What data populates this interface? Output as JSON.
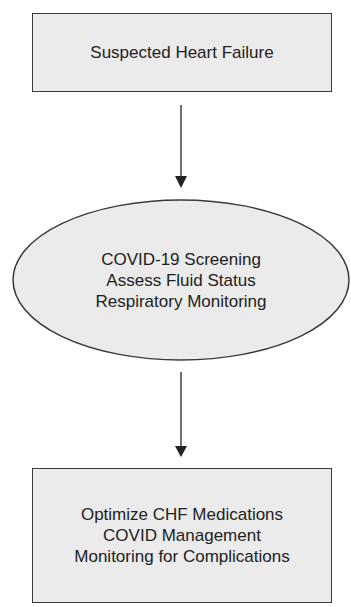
{
  "diagram": {
    "type": "flowchart",
    "nodes": [
      {
        "id": "n1",
        "shape": "rectangle",
        "lines": [
          "Suspected Heart Failure"
        ]
      },
      {
        "id": "n2",
        "shape": "ellipse",
        "lines": [
          "COVID-19 Screening",
          "Assess Fluid Status",
          "Respiratory Monitoring"
        ]
      },
      {
        "id": "n3",
        "shape": "rectangle",
        "lines": [
          "Optimize CHF Medications",
          "COVID Management",
          "Monitoring for Complications"
        ]
      }
    ],
    "edges": [
      {
        "from": "n1",
        "to": "n2"
      },
      {
        "from": "n2",
        "to": "n3"
      }
    ],
    "colors": {
      "fill": "#ebebeb",
      "stroke": "#3a3a3a",
      "text": "#222222"
    }
  }
}
